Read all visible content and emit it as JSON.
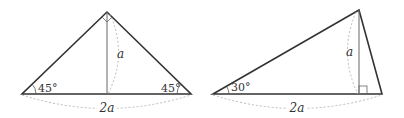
{
  "left_triangle": {
    "height_label": "a",
    "base_label": "2a",
    "angle_left": "45°",
    "angle_right": "45°"
  },
  "right_triangle": {
    "height_label": "a",
    "base_label": "2a",
    "angle_left": "30°"
  },
  "colors": {
    "line": "#333333",
    "dashed": "#aaaaaa",
    "altitude": "#666666"
  }
}
